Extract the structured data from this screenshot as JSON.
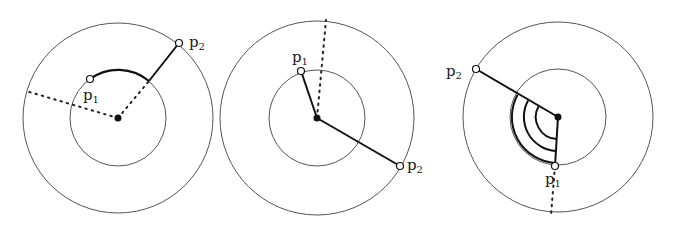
{
  "figure": {
    "panels": [
      {
        "id": "panel-1",
        "center": [
          118,
          118
        ],
        "outer_radius": 95,
        "inner_radius": 48,
        "p1": {
          "label": "p",
          "sub": "1",
          "pos": [
            89,
            79
          ],
          "label_pos": [
            83,
            100
          ]
        },
        "p2": {
          "label": "p",
          "sub": "2",
          "pos": [
            179,
            43
          ],
          "label_pos": [
            190,
            48
          ]
        },
        "solid_arc_from_p1_to_inner_point": [
          149,
          81
        ],
        "dotted_from_center": [
          [
            149,
            81
          ],
          [
            26,
            91
          ]
        ]
      },
      {
        "id": "panel-2",
        "center": [
          317,
          118
        ],
        "outer_radius": 97,
        "inner_radius": 48,
        "p1": {
          "label": "p",
          "sub": "1",
          "pos": [
            301,
            71
          ],
          "label_pos": [
            292,
            62
          ]
        },
        "p2": {
          "label": "p",
          "sub": "2",
          "pos": [
            400,
            166
          ],
          "label_pos": [
            407,
            172
          ]
        },
        "dotted_from_center": [
          [
            326,
            20
          ]
        ]
      },
      {
        "id": "panel-3",
        "center": [
          558,
          117
        ],
        "outer_radius": 95,
        "inner_radius": 48,
        "p1": {
          "label": "p",
          "sub": "1",
          "pos": [
            555,
            166
          ],
          "label_pos": [
            544,
            186
          ]
        },
        "p2": {
          "label": "p",
          "sub": "2",
          "pos": [
            476,
            69
          ],
          "label_pos": [
            447,
            78
          ]
        },
        "angle_arc_radii": [
          22,
          34,
          46
        ],
        "dotted_from_p1": [
          [
            551,
            215
          ]
        ]
      }
    ]
  }
}
